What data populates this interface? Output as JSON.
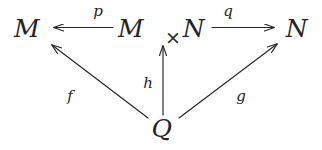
{
  "diagram": {
    "kind": "commutative-diagram",
    "background_color": "#ffffff",
    "ink_color": "#242424",
    "nodes": [
      {
        "id": "M",
        "label": "M",
        "x": 27,
        "y": 28
      },
      {
        "id": "MxN_M",
        "label": "M",
        "x": 131,
        "y": 28
      },
      {
        "id": "MxN_op",
        "label": "×",
        "x": 162,
        "y": 28
      },
      {
        "id": "MxN_N",
        "label": "N",
        "x": 194,
        "y": 28
      },
      {
        "id": "N",
        "label": "N",
        "x": 297,
        "y": 28
      },
      {
        "id": "Q",
        "label": "Q",
        "x": 162,
        "y": 128
      }
    ],
    "edges": [
      {
        "id": "p",
        "label": "p",
        "from": "MxN",
        "to": "M",
        "label_x": 98,
        "label_y": 11
      },
      {
        "id": "q",
        "label": "q",
        "from": "MxN",
        "to": "N",
        "label_x": 228,
        "label_y": 11
      },
      {
        "id": "f",
        "label": "f",
        "from": "Q",
        "to": "M",
        "label_x": 70,
        "label_y": 96
      },
      {
        "id": "h",
        "label": "h",
        "from": "Q",
        "to": "MxN",
        "label_x": 148,
        "label_y": 83
      },
      {
        "id": "g",
        "label": "g",
        "from": "Q",
        "to": "N",
        "label_x": 241,
        "label_y": 96
      }
    ]
  }
}
